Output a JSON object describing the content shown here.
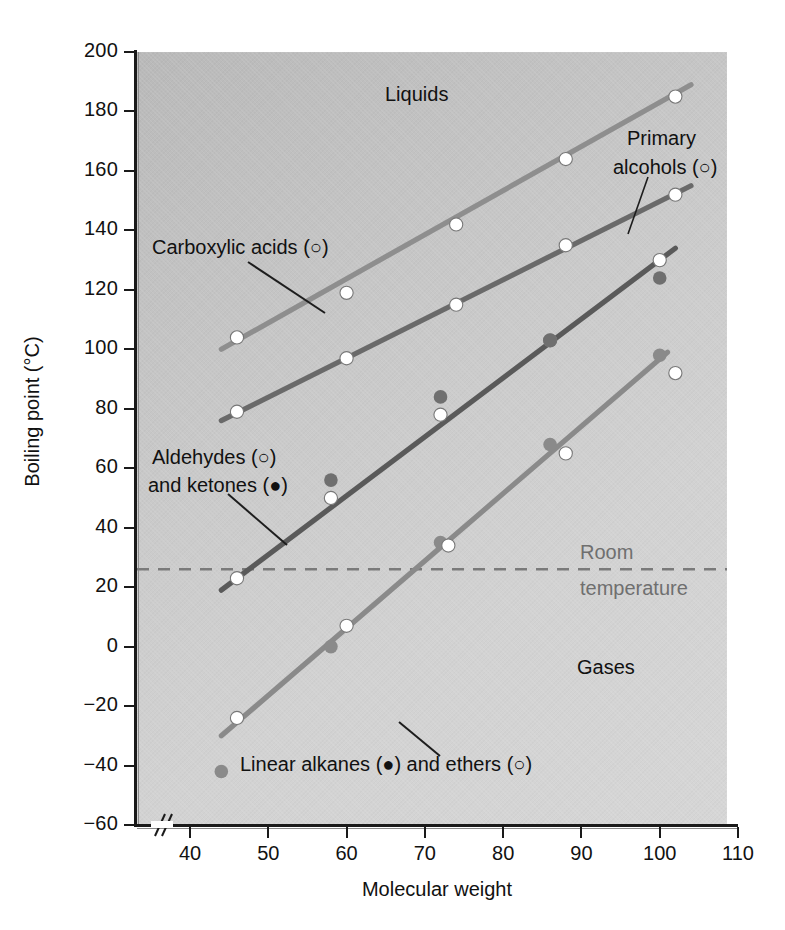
{
  "chart_data": {
    "type": "scatter",
    "title": "",
    "xlabel": "Molecular weight",
    "ylabel": "Boiling point (°C)",
    "xlim": [
      33,
      110
    ],
    "ylim": [
      -60,
      200
    ],
    "xticks": [
      40,
      50,
      60,
      70,
      80,
      90,
      100,
      110
    ],
    "yticks": [
      200,
      180,
      160,
      140,
      120,
      100,
      80,
      60,
      40,
      20,
      0,
      -20,
      -40,
      -60
    ],
    "xtick_labels": [
      "40",
      "50",
      "60",
      "70",
      "80",
      "90",
      "100",
      "110"
    ],
    "ytick_labels": [
      "200",
      "180",
      "160",
      "140",
      "120",
      "100",
      "80",
      "60",
      "40",
      "20",
      "0",
      "−20",
      "−40",
      "−60"
    ],
    "grid": false,
    "axis_break": true,
    "legend_position": "inline-annotations",
    "reference_line": {
      "label_line1": "Room",
      "label_line2": "temperature",
      "value": 26,
      "style": "dashed",
      "color": "#7a7a7a"
    },
    "region_labels": [
      {
        "text": "Liquids",
        "x": 85,
        "y": 185
      },
      {
        "text": "Gases",
        "x": 88,
        "y": -24
      }
    ],
    "series": [
      {
        "name": "Carboxylic acids",
        "marker": "open-circle",
        "color": "#8e8e8e",
        "label": "Carboxylic acids (○)",
        "x": [
          46,
          60,
          74,
          88,
          102
        ],
        "y": [
          104,
          119,
          142,
          164,
          185
        ],
        "fit_line": {
          "x": [
            44,
            104
          ],
          "y": [
            100,
            189
          ]
        }
      },
      {
        "name": "Primary alcohols",
        "marker": "open-circle",
        "color": "#6a6a6a",
        "label": "Primary alcohols (○)",
        "x": [
          46,
          60,
          74,
          88,
          102
        ],
        "y": [
          79,
          97,
          115,
          135,
          152
        ],
        "fit_line": {
          "x": [
            44,
            104
          ],
          "y": [
            76,
            155
          ]
        }
      },
      {
        "name": "Aldehydes",
        "marker": "open-circle",
        "color": "#5a5a5a",
        "label": "Aldehydes (○)",
        "x": [
          46,
          58,
          72,
          86,
          100
        ],
        "y": [
          23,
          50,
          78,
          103,
          130
        ],
        "fit_line": {
          "x": [
            44,
            102
          ],
          "y": [
            19,
            134
          ]
        }
      },
      {
        "name": "Ketones",
        "marker": "filled-circle",
        "color": "#6f6f6f",
        "label": "and ketones (●)",
        "x": [
          58,
          72,
          86,
          100
        ],
        "y": [
          56,
          84,
          103,
          124
        ]
      },
      {
        "name": "Linear alkanes",
        "marker": "filled-circle",
        "color": "#8a8a8a",
        "label": "Linear alkanes (●)",
        "x": [
          44,
          58,
          72,
          86,
          100
        ],
        "y": [
          -42,
          0,
          35,
          68,
          98
        ],
        "fit_line": {
          "x": [
            44,
            101
          ],
          "y": [
            -30,
            99
          ]
        }
      },
      {
        "name": "Ethers",
        "marker": "open-circle",
        "color": "#ffffff",
        "label": "and ethers (○)",
        "x": [
          46,
          60,
          73,
          88,
          102
        ],
        "y": [
          -24,
          7,
          34,
          65,
          92
        ]
      }
    ],
    "annotations": [
      {
        "name": "carboxylic-acids-label",
        "text": "Carboxylic acids (○)"
      },
      {
        "name": "primary-alcohols-label",
        "text_line1": "Primary",
        "text_line2": "alcohols (○)"
      },
      {
        "name": "aldehydes-ketones-label",
        "text_line1": "Aldehydes (○)",
        "text_line2": "and ketones (●)"
      },
      {
        "name": "alkanes-ethers-label",
        "text": "Linear alkanes (●) and ethers (○)"
      }
    ]
  },
  "axes": {
    "y_title": "Boiling point (°C)",
    "x_title": "Molecular weight",
    "y_labels": [
      "200",
      "180",
      "160",
      "140",
      "120",
      "100",
      "80",
      "60",
      "40",
      "20",
      "0",
      "−20",
      "−40",
      "−60"
    ],
    "x_labels": [
      "40",
      "50",
      "60",
      "70",
      "80",
      "90",
      "100",
      "110"
    ]
  },
  "labels": {
    "liquids": "Liquids",
    "gases": "Gases",
    "room": "Room",
    "temperature": "temperature",
    "carboxylic_acids": "Carboxylic acids (○)",
    "primary_line1": "Primary",
    "primary_line2": "alcohols (○)",
    "aldehydes": "Aldehydes (○)",
    "ketones": "and ketones (●)",
    "alkanes_ethers": "Linear alkanes (●) and ethers (○)"
  },
  "colors": {
    "acids_line": "#8e8e8e",
    "alcohols_line": "#6a6a6a",
    "aldehydes_line": "#5a5a5a",
    "alkanes_line": "#8a8a8a",
    "room_temp": "#7a7a7a",
    "axis": "#1a1a1a"
  }
}
